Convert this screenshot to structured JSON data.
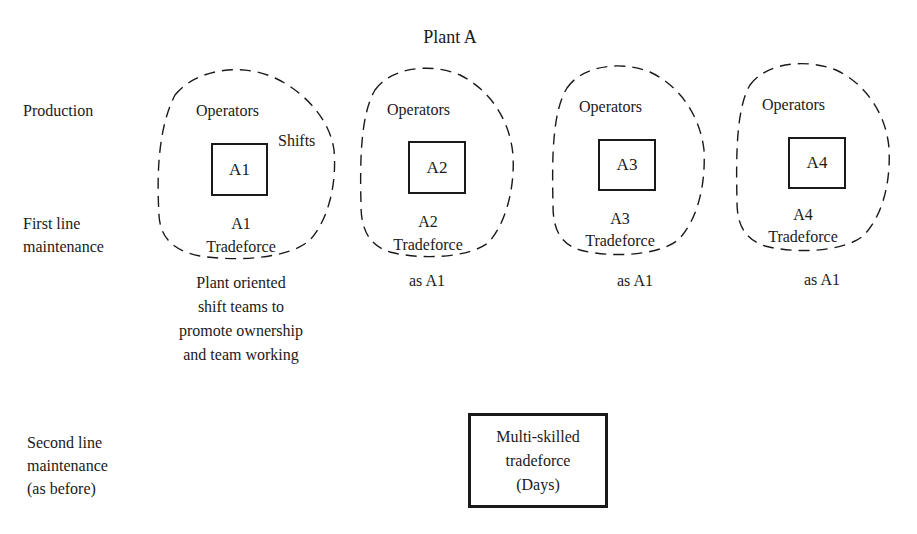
{
  "title": "Plant A",
  "row_labels": {
    "production": "Production",
    "first_line": [
      "First line",
      "maintenance"
    ],
    "second_line": [
      "Second line",
      "maintenance",
      "(as before)"
    ]
  },
  "plants": [
    {
      "unit": "A1",
      "operators": "Operators",
      "shifts": "Shifts",
      "tradeforce_unit": "A1",
      "tradeforce": "Tradeforce",
      "note": [
        "Plant oriented",
        "shift teams to",
        "promote ownership",
        "and team working"
      ]
    },
    {
      "unit": "A2",
      "operators": "Operators",
      "tradeforce_unit": "A2",
      "tradeforce": "Tradeforce",
      "note": [
        "as A1"
      ]
    },
    {
      "unit": "A3",
      "operators": "Operators",
      "tradeforce_unit": "A3",
      "tradeforce": "Tradeforce",
      "note": [
        "as A1"
      ]
    },
    {
      "unit": "A4",
      "operators": "Operators",
      "tradeforce_unit": "A4",
      "tradeforce": "Tradeforce",
      "note": [
        "as A1"
      ]
    }
  ],
  "second_line_box": [
    "Multi-skilled",
    "tradeforce",
    "(Days)"
  ]
}
